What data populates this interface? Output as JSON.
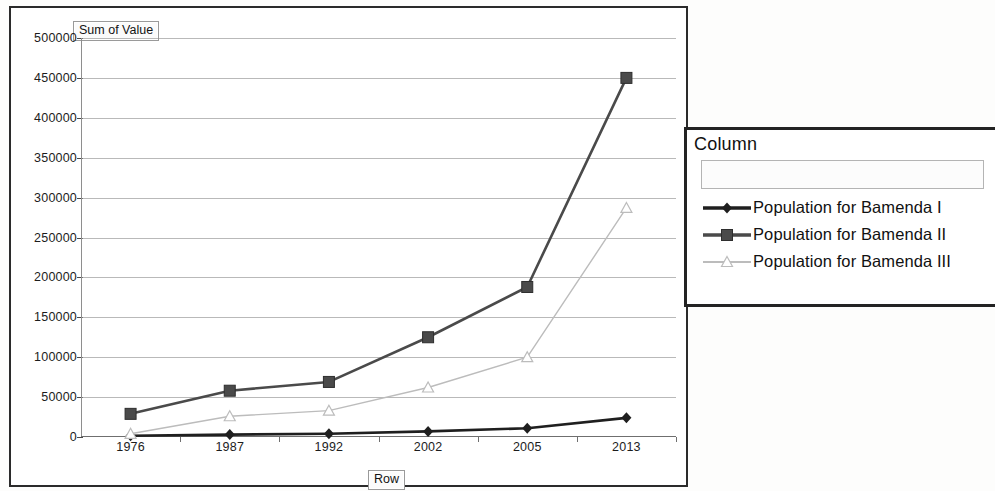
{
  "chart": {
    "value_field_label": "Sum of Value",
    "row_field_label": "Row",
    "legend": {
      "title": "Column",
      "items": [
        {
          "label": "Population for Bamenda I",
          "marker": "diamond-marker-icon",
          "color": "#1f1f1f"
        },
        {
          "label": "Population for Bamenda II",
          "marker": "square-marker-icon",
          "color": "#4a4a4a"
        },
        {
          "label": "Population for Bamenda III",
          "marker": "triangle-marker-icon",
          "color": "#bcbcbc"
        }
      ]
    }
  },
  "chart_data": {
    "type": "line",
    "title": "Sum of Value",
    "xlabel": "Row",
    "ylabel": "Sum of Value",
    "categories": [
      "1976",
      "1987",
      "1992",
      "2002",
      "2005",
      "2013"
    ],
    "series": [
      {
        "name": "Population for Bamenda I",
        "marker": "diamond",
        "color": "#1f1f1f",
        "values": [
          1500,
          3000,
          4000,
          7000,
          11000,
          24000
        ]
      },
      {
        "name": "Population for Bamenda II",
        "marker": "square",
        "color": "#4a4a4a",
        "values": [
          29000,
          58000,
          69000,
          125000,
          188000,
          450000
        ]
      },
      {
        "name": "Population for Bamenda III",
        "marker": "triangle",
        "color": "#bcbcbc",
        "values": [
          4000,
          26000,
          33000,
          62000,
          100000,
          287000
        ]
      }
    ],
    "ylim": [
      0,
      500000
    ],
    "yticks": [
      0,
      50000,
      100000,
      150000,
      200000,
      250000,
      300000,
      350000,
      400000,
      450000,
      500000
    ],
    "ytick_labels": [
      "0",
      "50000",
      "100000",
      "150000",
      "200000",
      "250000",
      "300000",
      "350000",
      "400000",
      "450000",
      "500000"
    ],
    "grid": true,
    "legend_position": "right"
  }
}
